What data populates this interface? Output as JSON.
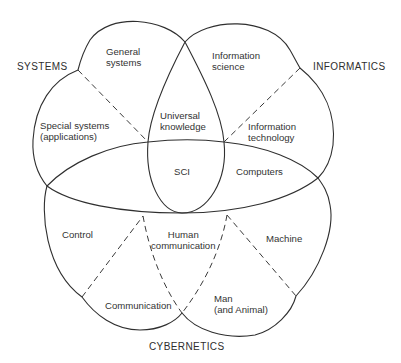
{
  "diagram": {
    "headings": {
      "systems": "SYSTEMS",
      "informatics": "INFORMATICS",
      "cybernetics": "CYBERNETICS"
    },
    "regions": {
      "general_systems": [
        "General",
        "systems"
      ],
      "special_systems": [
        "Special systems",
        "(applications)"
      ],
      "universal_knowledge": [
        "Universal",
        "knowledge"
      ],
      "information_science": [
        "Information",
        "science"
      ],
      "information_technology": [
        "Information",
        "technology"
      ],
      "sci": "SCI",
      "computers": "Computers",
      "control": "Control",
      "human_communication": [
        "Human",
        "communication"
      ],
      "machine": "Machine",
      "communication": "Communication",
      "man_and_animal": [
        "Man",
        "(and Animal)"
      ]
    },
    "colors": {
      "line": "#2f2f2f",
      "background": "#ffffff",
      "text": "#333333"
    }
  }
}
